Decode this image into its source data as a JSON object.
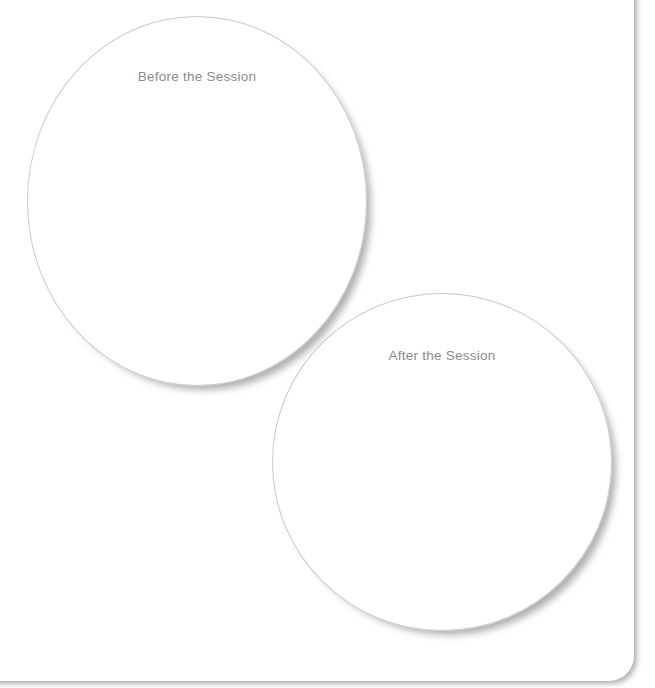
{
  "document": {
    "type": "worksheet",
    "background_color": "#ffffff",
    "paper_color": "#ffffff",
    "paper_edge_color": "#b9b9b9"
  },
  "diagram": {
    "kind": "two-circle-comparison",
    "stroke_color": "#c9c9cf",
    "shadow_color": "#808082",
    "text_color": "#8b8b8d",
    "circles": [
      {
        "id": "before",
        "label": "Before the Session",
        "center_x": 196,
        "center_y": 200,
        "radius": 169
      },
      {
        "id": "after",
        "label": "After the Session",
        "center_x": 441,
        "center_y": 461,
        "radius": 168
      }
    ]
  }
}
